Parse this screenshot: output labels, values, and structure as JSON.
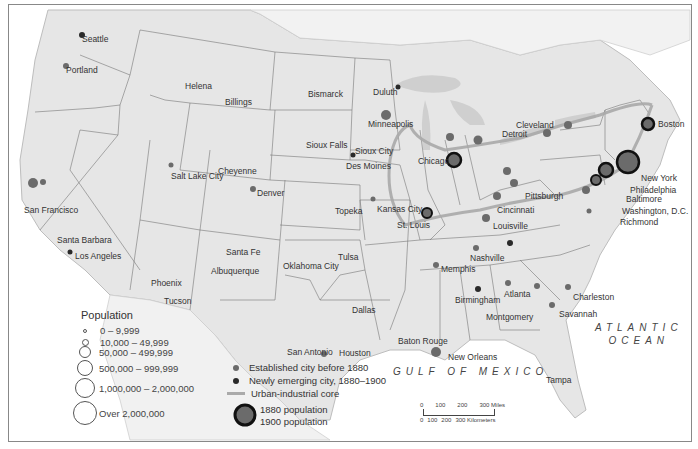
{
  "map": {
    "title": "Urbanization of the United States, 1880–1900",
    "oceans": {
      "atlantic_line1": "ATLANTIC",
      "atlantic_line2": "OCEAN",
      "gulf": "GULF OF MEXICO"
    },
    "cities": [
      {
        "name": "Seattle",
        "x": 82,
        "y": 35
      },
      {
        "name": "Portland",
        "x": 66,
        "y": 66
      },
      {
        "name": "Helena",
        "x": 185,
        "y": 82
      },
      {
        "name": "Billings",
        "x": 225,
        "y": 98
      },
      {
        "name": "Bismarck",
        "x": 308,
        "y": 90
      },
      {
        "name": "Duluth",
        "x": 373,
        "y": 88
      },
      {
        "name": "Minneapolis",
        "x": 368,
        "y": 120
      },
      {
        "name": "Sioux Falls",
        "x": 306,
        "y": 141
      },
      {
        "name": "Sioux City",
        "x": 355,
        "y": 147
      },
      {
        "name": "Des Moines",
        "x": 346,
        "y": 162
      },
      {
        "name": "Cheyenne",
        "x": 218,
        "y": 167
      },
      {
        "name": "Salt Lake City",
        "x": 171,
        "y": 172
      },
      {
        "name": "Denver",
        "x": 257,
        "y": 189
      },
      {
        "name": "San Francisco",
        "x": 24,
        "y": 206
      },
      {
        "name": "Topeka",
        "x": 335,
        "y": 207
      },
      {
        "name": "Kansas City",
        "x": 377,
        "y": 205
      },
      {
        "name": "St. Louis",
        "x": 397,
        "y": 221
      },
      {
        "name": "Chicago",
        "x": 418,
        "y": 157
      },
      {
        "name": "Detroit",
        "x": 502,
        "y": 130
      },
      {
        "name": "Cleveland",
        "x": 516,
        "y": 121
      },
      {
        "name": "Pittsburgh",
        "x": 525,
        "y": 192
      },
      {
        "name": "Cincinnati",
        "x": 497,
        "y": 206
      },
      {
        "name": "Louisville",
        "x": 493,
        "y": 222
      },
      {
        "name": "Boston",
        "x": 658,
        "y": 120
      },
      {
        "name": "New York",
        "x": 641,
        "y": 174
      },
      {
        "name": "Philadelphia",
        "x": 630,
        "y": 186
      },
      {
        "name": "Baltimore",
        "x": 626,
        "y": 195
      },
      {
        "name": "Washington, D.C.",
        "x": 622,
        "y": 207
      },
      {
        "name": "Richmond",
        "x": 620,
        "y": 218
      },
      {
        "name": "Santa Barbara",
        "x": 57,
        "y": 236
      },
      {
        "name": "Los Angeles",
        "x": 75,
        "y": 252
      },
      {
        "name": "Santa Fe",
        "x": 226,
        "y": 248
      },
      {
        "name": "Albuquerque",
        "x": 211,
        "y": 267
      },
      {
        "name": "Oklahoma City",
        "x": 283,
        "y": 262
      },
      {
        "name": "Tulsa",
        "x": 338,
        "y": 253
      },
      {
        "name": "Nashville",
        "x": 470,
        "y": 254
      },
      {
        "name": "Memphis",
        "x": 441,
        "y": 265
      },
      {
        "name": "Phoenix",
        "x": 151,
        "y": 279
      },
      {
        "name": "Tucson",
        "x": 164,
        "y": 297
      },
      {
        "name": "Dallas",
        "x": 352,
        "y": 306
      },
      {
        "name": "Birmingham",
        "x": 455,
        "y": 296
      },
      {
        "name": "Atlanta",
        "x": 504,
        "y": 290
      },
      {
        "name": "Montgomery",
        "x": 486,
        "y": 313
      },
      {
        "name": "Charleston",
        "x": 573,
        "y": 293
      },
      {
        "name": "Savannah",
        "x": 559,
        "y": 310
      },
      {
        "name": "San Antonio",
        "x": 287,
        "y": 348
      },
      {
        "name": "Houston",
        "x": 339,
        "y": 349
      },
      {
        "name": "Baton Rouge",
        "x": 398,
        "y": 337
      },
      {
        "name": "New Orleans",
        "x": 448,
        "y": 353
      },
      {
        "name": "Tampa",
        "x": 546,
        "y": 376
      }
    ]
  },
  "legend": {
    "population_title": "Population",
    "population_classes": [
      "0 – 9,999",
      "10,000 – 49,999",
      "50,000 – 499,999",
      "500,000 – 999,999",
      "1,000,000 – 2,000,000",
      "Over 2,000,000"
    ],
    "symbols": {
      "established": "Established city before 1880",
      "emerging": "Newly emerging city, 1880–1900",
      "core": "Urban-industrial core",
      "pop1880": "1880 population",
      "pop1900": "1900 population"
    },
    "colors": {
      "established": "#6b6b6b",
      "emerging": "#2a2a2a",
      "core": "#a9a9a9",
      "land": "#e6e6e6",
      "water": "#ffffff"
    }
  },
  "scale_bar": {
    "miles": [
      "0",
      "100",
      "200",
      "300 Miles"
    ],
    "kilometers": [
      "0",
      "100",
      "200",
      "300 Kilometers"
    ]
  }
}
